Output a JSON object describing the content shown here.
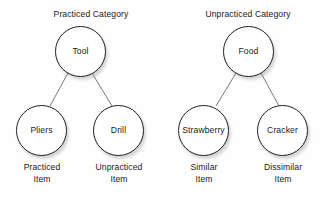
{
  "diagram": {
    "type": "hierarchy",
    "background_color": "#fefefe",
    "node_fill": "#ffffff",
    "node_stroke": "#1f1f1f",
    "edge_stroke": "#6b6b6b",
    "text_color": "#1a1a1a",
    "groups": [
      {
        "id": "practiced-category",
        "title": "Practiced Category",
        "root": {
          "id": "tool",
          "label": "Tool"
        },
        "children": [
          {
            "id": "pliers",
            "label": "Pliers",
            "caption_line1": "Practiced",
            "caption_line2": "Item"
          },
          {
            "id": "drill",
            "label": "Drill",
            "caption_line1": "Unpracticed",
            "caption_line2": "Item"
          }
        ]
      },
      {
        "id": "unpracticed-category",
        "title": "Unpracticed Category",
        "root": {
          "id": "food",
          "label": "Food"
        },
        "children": [
          {
            "id": "strawberry",
            "label": "Strawberry",
            "caption_line1": "Similar",
            "caption_line2": "Item"
          },
          {
            "id": "cracker",
            "label": "Cracker",
            "caption_line1": "Dissimilar",
            "caption_line2": "Item"
          }
        ]
      }
    ]
  }
}
